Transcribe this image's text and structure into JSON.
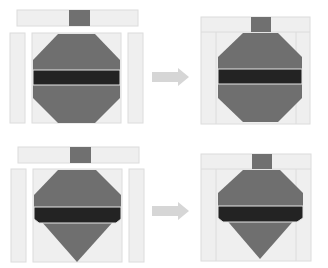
{
  "figure": {
    "colors": {
      "background_fabric": "#efefef",
      "seam": "#d8d8d8",
      "ornament_body": "#6f6f6f",
      "ornament_band": "#232323",
      "band_edge": "#e6e6e6",
      "arrow": "#d6d6d6"
    },
    "rows": [
      {
        "name": "row-1-octagon",
        "shape": "octagon",
        "step_from": "exploded",
        "step_to": "assembled"
      },
      {
        "name": "row-2-spinning-top",
        "shape": "top-with-point",
        "step_from": "exploded",
        "step_to": "assembled"
      }
    ]
  }
}
